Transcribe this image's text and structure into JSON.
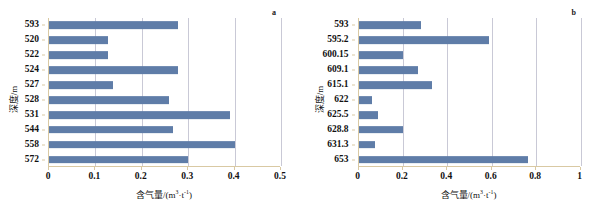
{
  "figure": {
    "panel_a_letter": "a",
    "panel_b_letter": "b",
    "bar_color": "#5f7da8",
    "gridline_color": "#c9c9d6",
    "axis_color": "#d9c9a3"
  },
  "chart_data": [
    {
      "type": "bar",
      "orientation": "horizontal",
      "panel": "a",
      "title": "",
      "xlabel_text": "含气量/(m³·t⁻¹)",
      "xlabel_prefix": "含气量/(m",
      "xlabel_sup1": "3",
      "xlabel_mid": "·t",
      "xlabel_sup2": "-1",
      "xlabel_suffix": ")",
      "ylabel": "深度/m",
      "categories": [
        "593",
        "520",
        "522",
        "524",
        "527",
        "528",
        "531",
        "544",
        "558",
        "572"
      ],
      "values": [
        0.278,
        0.128,
        0.128,
        0.278,
        0.138,
        0.258,
        0.39,
        0.268,
        0.4,
        0.3
      ],
      "xlim": [
        0,
        0.5
      ],
      "xticks": [
        "0",
        "0.1",
        "0.2",
        "0.3",
        "0.4",
        "0.5"
      ],
      "xtick_values": [
        0,
        0.1,
        0.2,
        0.3,
        0.4,
        0.5
      ],
      "grid": true,
      "legend": "none"
    },
    {
      "type": "bar",
      "orientation": "horizontal",
      "panel": "b",
      "title": "",
      "xlabel_text": "含气量/(m³·t⁻¹)",
      "xlabel_prefix": "含气量/(m",
      "xlabel_sup1": "3",
      "xlabel_mid": "·t",
      "xlabel_sup2": "-1",
      "xlabel_suffix": ")",
      "ylabel": "深度/m",
      "categories": [
        "593",
        "595.2",
        "600.15",
        "609.1",
        "615.1",
        "622",
        "625.5",
        "628.8",
        "631.3",
        "653"
      ],
      "values": [
        0.28,
        0.59,
        0.2,
        0.27,
        0.33,
        0.06,
        0.09,
        0.2,
        0.075,
        0.765
      ],
      "xlim": [
        0,
        1
      ],
      "xticks": [
        "0",
        "0.2",
        "0.4",
        "0.6",
        "0.8",
        "1"
      ],
      "xtick_values": [
        0,
        0.2,
        0.4,
        0.6,
        0.8,
        1.0
      ],
      "grid": true,
      "legend": "none"
    }
  ]
}
